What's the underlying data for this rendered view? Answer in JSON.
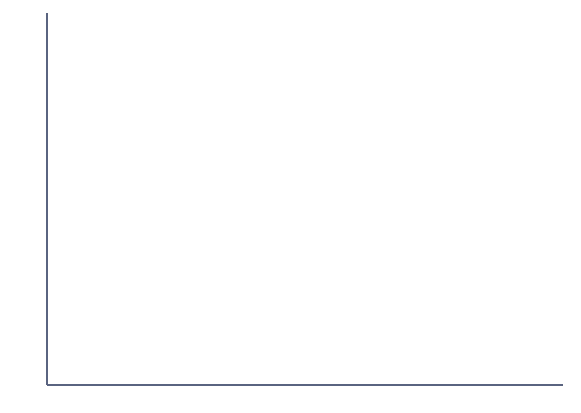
{
  "chart_data": {
    "type": "area",
    "title": "",
    "subtitle": "",
    "xlabel": "",
    "ylabel": "Fatalities (in thousands)",
    "xlim": [
      1977,
      2001
    ],
    "ylim": [
      0,
      60
    ],
    "grid": true,
    "grid_axis": "y",
    "legend_position": "inline-annotations",
    "stacked": true,
    "x": [
      1977,
      1978,
      1979,
      1980,
      1981,
      1982,
      1983,
      1984,
      1985,
      1986,
      1987,
      1988,
      1989,
      1990,
      1991,
      1992,
      1993,
      1994,
      1995,
      1996,
      1997,
      1998,
      1999,
      2000,
      2001
    ],
    "y_ticks": [
      0,
      10,
      20,
      30,
      40,
      50,
      60
    ],
    "y_tick_labels": [
      "0",
      "10",
      "20",
      "30",
      "40",
      "50",
      "60"
    ],
    "x_ticks": [
      1977,
      1978,
      1979,
      1980,
      1981,
      1982,
      1983,
      1984,
      1985,
      1986,
      1987,
      1988,
      1989,
      1990,
      1991,
      1992,
      1993,
      1994,
      1995,
      1996,
      1997,
      1998,
      1999,
      2000,
      2001
    ],
    "x_tick_labels": [
      "1977",
      "",
      "1979",
      "",
      "1981",
      "",
      "1983",
      "",
      "1985",
      "",
      "1987",
      "",
      "1989",
      "",
      "1991",
      "",
      "1993",
      "",
      "1995",
      "",
      "1997",
      "",
      "1999",
      "",
      "2001"
    ],
    "series": [
      {
        "name": "Alcohol-related fatalities",
        "label": "Alcohol-related fatalities",
        "color": "#d4492a",
        "fill": "#f7e3bd",
        "values": [
          17.5,
          19.0,
          20.5,
          21.3,
          21.2,
          20.8,
          18.8,
          18.6,
          19.2,
          19.3,
          20.5,
          19.6,
          19.2,
          19.3,
          18.9,
          16.7,
          15.5,
          15.3,
          14.6,
          14.5,
          14.2,
          13.8,
          13.3,
          13.8,
          13.7
        ]
      },
      {
        "name": "Nonalcohol-related fatalities",
        "label": "Nonalcohol-related fatalities",
        "color": "#2c8ba3",
        "fill": "#b8d8e4",
        "values": [
          30.3,
          32.0,
          30.5,
          29.9,
          29.7,
          25.2,
          24.3,
          24.6,
          24.8,
          25.9,
          27.0,
          27.9,
          26.3,
          25.1,
          22.1,
          23.3,
          24.2,
          25.0,
          26.4,
          27.5,
          27.9,
          28.6,
          29.0,
          28.6,
          29.2
        ]
      }
    ],
    "totals_top_line": [
      47.9,
      51.0,
      51.0,
      51.2,
      50.9,
      46.0,
      43.1,
      43.2,
      44.0,
      45.2,
      47.5,
      47.5,
      45.5,
      44.4,
      41.0,
      40.0,
      39.7,
      40.3,
      41.0,
      42.0,
      42.1,
      42.4,
      42.3,
      42.4,
      42.9
    ],
    "annotations": [
      {
        "text": "Nonalcohol-related fatalities",
        "x": 1988,
        "y": 32
      },
      {
        "text": "Alcohol-related fatalities",
        "x": 1988,
        "y": 11.5
      }
    ]
  },
  "axes": {
    "y_title": "Fatalities (in thousands)"
  },
  "colors": {
    "blue_line": "#2c8ba3",
    "blue_fill": "#b8d8e4",
    "red_line": "#d4492a",
    "tan_fill": "#f7e3bd",
    "grid": "#9aa6c4",
    "axis": "#5a6480",
    "background": "#ffffff"
  }
}
